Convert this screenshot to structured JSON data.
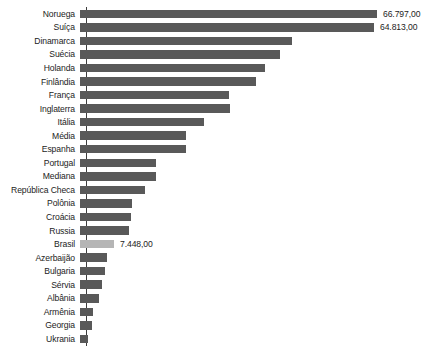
{
  "chart_data": {
    "type": "bar",
    "orientation": "horizontal",
    "title": "",
    "subtitle": "",
    "xlabel": "",
    "ylabel": "",
    "grid": false,
    "legend": null,
    "axis": {
      "x_ticks_visible": false,
      "y_axis_line": true,
      "xlim": [
        0,
        66797
      ]
    },
    "number_format": "pt-BR (thousands '.', decimals ',')",
    "highlight_category": "Brasil",
    "colors": {
      "bar": "#595959",
      "bar_highlight": "#b5b5b5",
      "axis": "#3d3d3d",
      "text": "#1c1c1c",
      "background": "#ffffff"
    },
    "categories": [
      "Noruega",
      "Suíça",
      "Dinamarca",
      "Suécia",
      "Holanda",
      "Finlândia",
      "França",
      "Inglaterra",
      "Itália",
      "Média",
      "Espanha",
      "Portugal",
      "Mediana",
      "República Checa",
      "Polônia",
      "Croácia",
      "Russia",
      "Brasil",
      "Azerbaijão",
      "Bulgaria",
      "Sérvia",
      "Albânia",
      "Armênia",
      "Georgia",
      "Ukrania"
    ],
    "values": [
      66797,
      64813,
      44200,
      40200,
      35100,
      31900,
      26300,
      26600,
      14200,
      11700,
      11700,
      8700,
      8700,
      7300,
      5600,
      5400,
      5200,
      7448,
      4000,
      3700,
      3300,
      2800,
      1900,
      1800,
      1000
    ],
    "bars": [
      {
        "label": "Noruega",
        "value": 66797,
        "value_label": "66.797,00",
        "pixel_width": 297,
        "highlight": false
      },
      {
        "label": "Suíça",
        "value": 64813,
        "value_label": "64.813,00",
        "pixel_width": 294,
        "highlight": false
      },
      {
        "label": "Dinamarca",
        "value": null,
        "value_label": "",
        "pixel_width": 212,
        "highlight": false
      },
      {
        "label": "Suécia",
        "value": null,
        "value_label": "",
        "pixel_width": 200,
        "highlight": false
      },
      {
        "label": "Holanda",
        "value": null,
        "value_label": "",
        "pixel_width": 185,
        "highlight": false
      },
      {
        "label": "Finlândia",
        "value": null,
        "value_label": "",
        "pixel_width": 176,
        "highlight": false
      },
      {
        "label": "França",
        "value": null,
        "value_label": "",
        "pixel_width": 149,
        "highlight": false
      },
      {
        "label": "Inglaterra",
        "value": null,
        "value_label": "",
        "pixel_width": 150,
        "highlight": false
      },
      {
        "label": "Itália",
        "value": null,
        "value_label": "",
        "pixel_width": 124,
        "highlight": false
      },
      {
        "label": "Média",
        "value": null,
        "value_label": "",
        "pixel_width": 106,
        "highlight": false
      },
      {
        "label": "Espanha",
        "value": null,
        "value_label": "",
        "pixel_width": 106,
        "highlight": false
      },
      {
        "label": "Portugal",
        "value": null,
        "value_label": "",
        "pixel_width": 76,
        "highlight": false
      },
      {
        "label": "Mediana",
        "value": null,
        "value_label": "",
        "pixel_width": 76,
        "highlight": false
      },
      {
        "label": "República Checa",
        "value": null,
        "value_label": "",
        "pixel_width": 65,
        "highlight": false
      },
      {
        "label": "Polônia",
        "value": null,
        "value_label": "",
        "pixel_width": 52,
        "highlight": false
      },
      {
        "label": "Croácia",
        "value": null,
        "value_label": "",
        "pixel_width": 51,
        "highlight": false
      },
      {
        "label": "Russia",
        "value": null,
        "value_label": "",
        "pixel_width": 49,
        "highlight": false
      },
      {
        "label": "Brasil",
        "value": 7448,
        "value_label": "7.448,00",
        "pixel_width": 34,
        "highlight": true
      },
      {
        "label": "Azerbaijão",
        "value": null,
        "value_label": "",
        "pixel_width": 27,
        "highlight": false
      },
      {
        "label": "Bulgaria",
        "value": null,
        "value_label": "",
        "pixel_width": 25,
        "highlight": false
      },
      {
        "label": "Sérvia",
        "value": null,
        "value_label": "",
        "pixel_width": 22,
        "highlight": false
      },
      {
        "label": "Albânia",
        "value": null,
        "value_label": "",
        "pixel_width": 19,
        "highlight": false
      },
      {
        "label": "Armênia",
        "value": null,
        "value_label": "",
        "pixel_width": 13,
        "highlight": false
      },
      {
        "label": "Georgia",
        "value": null,
        "value_label": "",
        "pixel_width": 12,
        "highlight": false
      },
      {
        "label": "Ukrania",
        "value": null,
        "value_label": "",
        "pixel_width": 8,
        "highlight": false
      }
    ]
  }
}
